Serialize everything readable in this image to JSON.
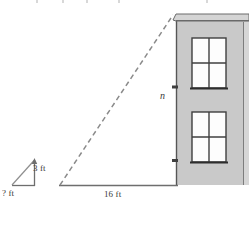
{
  "figure": {
    "name": "similar-triangles-building-height-diagram",
    "width": 249,
    "height": 227,
    "background_color": "#ffffff"
  },
  "labels": {
    "small_triangle_height": "3 ft",
    "small_triangle_base": "? ft",
    "ground_distance": "16 ft",
    "building_height_variable": "n"
  },
  "colors": {
    "ground_line": "#6e6e6e",
    "dashed_sight_line": "#8a8a8a",
    "building_fill": "#c9c9c9",
    "building_outline": "#5a5a5a",
    "roof_fill": "#d2d2d2",
    "window_fill": "#fdfdfd",
    "window_frame": "#3f3f3f",
    "text": "#3a3a3a",
    "tick_mark": "#4a4a4a"
  },
  "geometry": {
    "ground_line": {
      "x1": 60,
      "y1": 185,
      "x2": 224,
      "y2": 185
    },
    "sight_line": {
      "x1": 60,
      "y1": 185,
      "x2": 173,
      "y2": 16
    },
    "small_triangle": {
      "base": {
        "x1": 12,
        "y1": 185,
        "x2": 35,
        "y2": 185
      },
      "vertical": {
        "x1": 35,
        "y1": 185,
        "x2": 35,
        "y2": 161
      },
      "hypotenuse": {
        "x1": 12,
        "y1": 185,
        "x2": 35,
        "y2": 161
      }
    },
    "building": {
      "x": 176,
      "y": 20,
      "width": 73,
      "height": 165
    },
    "roof": {
      "x": 173,
      "y": 14,
      "width": 76,
      "height": 7
    },
    "windows": [
      {
        "x": 192,
        "y": 38,
        "width": 34,
        "height": 50
      },
      {
        "x": 192,
        "y": 112,
        "width": 34,
        "height": 50
      }
    ],
    "dimension_ticks": [
      {
        "x": 176,
        "y": 87
      },
      {
        "x": 176,
        "y": 160
      }
    ]
  }
}
